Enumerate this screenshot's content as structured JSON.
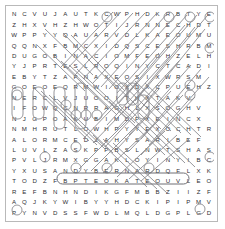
{
  "puzzle": {
    "type": "word-search",
    "rows": 20,
    "cols": 20,
    "grid": [
      "NCVUJAUTKCWPHDKRBTYE",
      "ZHXVHZHWOTIJRNNECHDTF",
      "WPPYYQAUARVDLKAEOUMU",
      "QQNXFBMCXIDQSCESHRBMA",
      "DUGOBINACIOMFEOHZELH",
      "YJPRTESLROQINYCTCADI",
      "EBYTZAPNAXEOSIXWRSM",
      "GOEOEQRMWIOXDXCPUEHZ",
      "NERCLVJUOOITHXTAKV",
      "IFOWQCNRRAGHLXSOGHV",
      "NJGPOAKUBIMDPXEINCX",
      "NMHRUTLOWHPYYEXOCHTR",
      "ALORMCEDJAHYSARIBEF",
      "LUVLZASKPPBSLNWTSHAS",
      "PVLJRMXGGAKLOYINYIBC",
      "YXUSANDYBERNARDQFLXK",
      "TODZFBPTEOKATEOUVLEO",
      "REFBNHNDIKGFMBBZIIZF",
      "AQJKYWIBYYHDCKIPIPMV",
      "PYNVDSSFWDLMQLDGPLGD"
    ],
    "found_words": [
      "ANDY BERNARD"
    ]
  },
  "marks": {
    "found_word_row": 16,
    "found_word_start_col": 5,
    "found_word_end_col": 17
  }
}
